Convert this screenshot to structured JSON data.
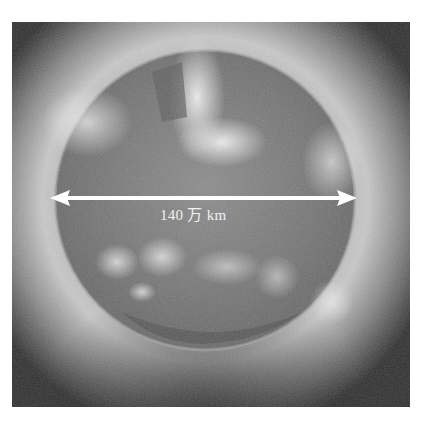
{
  "figure": {
    "measurement": {
      "label": "140 万 km",
      "value": "140",
      "unit_text": "万 km"
    },
    "colors": {
      "background": "#ffffff",
      "arrow": "#ffffff",
      "label": "#f2f2f2"
    }
  }
}
